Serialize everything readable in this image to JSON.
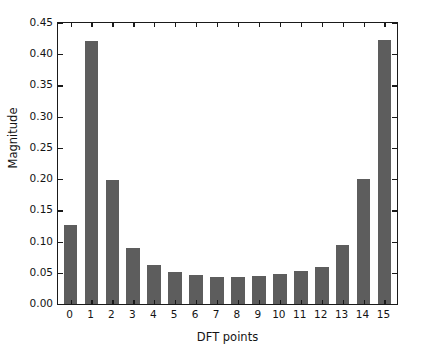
{
  "chart_data": {
    "type": "bar",
    "title": "",
    "subtitle": "",
    "xlabel": "DFT points",
    "ylabel": "Magnitude",
    "categories": [
      "0",
      "1",
      "2",
      "3",
      "4",
      "5",
      "6",
      "7",
      "8",
      "9",
      "10",
      "11",
      "12",
      "13",
      "14",
      "15"
    ],
    "values": [
      0.126,
      0.422,
      0.198,
      0.09,
      0.063,
      0.052,
      0.047,
      0.044,
      0.043,
      0.045,
      0.048,
      0.053,
      0.06,
      0.094,
      0.2,
      0.423
    ],
    "ylim": [
      0.0,
      0.45
    ],
    "xlim": [
      -0.6,
      15.6
    ],
    "yticks": [
      0.0,
      0.05,
      0.1,
      0.15,
      0.2,
      0.25,
      0.3,
      0.35,
      0.4,
      0.45
    ],
    "ytick_labels": [
      "0.00",
      "0.05",
      "0.10",
      "0.15",
      "0.20",
      "0.25",
      "0.30",
      "0.35",
      "0.40",
      "0.45"
    ],
    "xtick_labels": [
      "0",
      "1",
      "2",
      "3",
      "4",
      "5",
      "6",
      "7",
      "8",
      "9",
      "10",
      "11",
      "12",
      "13",
      "14",
      "15"
    ],
    "grid": false,
    "legend": null,
    "bar_color": "#5d5d5d",
    "axis_color": "#1a1a1a",
    "background_color": "#ffffff",
    "annotations": []
  }
}
